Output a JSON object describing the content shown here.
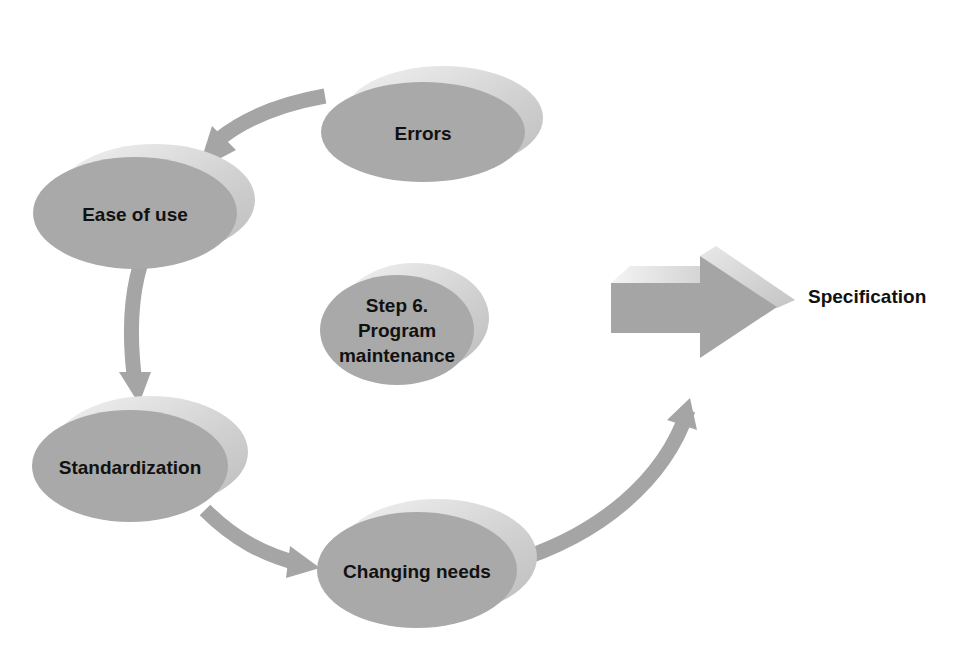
{
  "diagram": {
    "type": "cycle",
    "center_label": {
      "line1": "Step 6.",
      "line2": "Program",
      "line3": "maintenance"
    },
    "nodes": [
      {
        "id": "errors",
        "label": "Errors"
      },
      {
        "id": "ease",
        "label": "Ease of use"
      },
      {
        "id": "standard",
        "label": "Standardization"
      },
      {
        "id": "changing",
        "label": "Changing needs"
      }
    ],
    "output": {
      "label": "Specification"
    },
    "colors": {
      "node_fill": "#a9a9a9",
      "node_shadow": "#d4d4d4",
      "arrow_fill": "#a5a5a5",
      "text": "#111111",
      "background": "#ffffff"
    }
  }
}
